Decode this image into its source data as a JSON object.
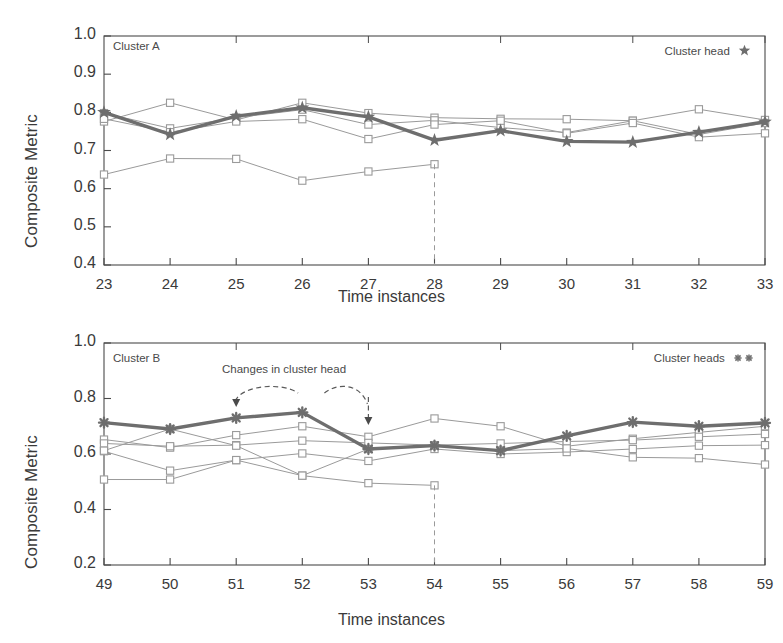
{
  "figure": {
    "background": "#ffffff",
    "ink_color": "#4a4a4a",
    "series_line_color": "#9a9a9a",
    "highlight_color": "#6e6e6e"
  },
  "panels": [
    {
      "id": "cluster-a",
      "tag": "Cluster A",
      "legend_text": "Cluster head",
      "legend_marker": "star",
      "legend_marker_count": 1,
      "xlabel": "Time instances",
      "ylabel": "Composite Metric"
    },
    {
      "id": "cluster-b",
      "tag": "Cluster B",
      "legend_text": "Cluster heads",
      "legend_marker": "asterisk",
      "legend_marker_count": 2,
      "xlabel": "Time instances",
      "ylabel": "Composite Metric",
      "annotation": "Changes in cluster head"
    }
  ],
  "chart_data": [
    {
      "type": "line",
      "id": "cluster-a",
      "title": "Cluster A",
      "xlabel": "Time instances",
      "ylabel": "Composite Metric",
      "x": [
        23,
        24,
        25,
        26,
        27,
        28,
        29,
        30,
        31,
        32,
        33
      ],
      "xticks": [
        "23",
        "24",
        "25",
        "26",
        "27",
        "28",
        "29",
        "30",
        "31",
        "32",
        "33"
      ],
      "yticks": [
        "0.4",
        "0.5",
        "0.6",
        "0.7",
        "0.8",
        "0.9",
        "1.0"
      ],
      "xlim": [
        23,
        33
      ],
      "ylim": [
        0.4,
        1.0
      ],
      "grid": false,
      "legend": "Cluster head",
      "legend_position": "top-right",
      "series": [
        {
          "name": "cluster head",
          "role": "highlight",
          "marker": "star",
          "linewidth": "thick",
          "values": [
            0.8,
            0.742,
            0.79,
            0.812,
            0.788,
            0.727,
            0.752,
            0.724,
            0.722,
            0.748,
            0.775
          ]
        },
        {
          "name": "member 1",
          "role": "member",
          "marker": "square",
          "linewidth": "thin",
          "values": [
            0.776,
            0.825,
            0.78,
            0.825,
            0.798,
            0.786,
            0.783,
            0.782,
            0.778,
            0.808,
            0.78
          ]
        },
        {
          "name": "member 2",
          "role": "member",
          "marker": "square",
          "linewidth": "thin",
          "values": [
            0.798,
            0.758,
            0.786,
            0.807,
            0.768,
            0.779,
            0.76,
            0.747,
            0.778,
            0.742,
            0.772
          ]
        },
        {
          "name": "member 3",
          "role": "member",
          "marker": "square",
          "linewidth": "thin",
          "values": [
            0.783,
            0.748,
            0.776,
            0.782,
            0.73,
            0.768,
            0.778,
            0.745,
            0.772,
            0.735,
            0.745
          ]
        },
        {
          "name": "departing member",
          "role": "member-terminating",
          "marker": "square",
          "linewidth": "thin",
          "ends_at": 28,
          "values": [
            0.637,
            0.679,
            0.678,
            0.621,
            0.645,
            0.664
          ]
        }
      ],
      "annotations": [
        {
          "kind": "dashed-vline",
          "x": 28,
          "from_series": "departing member",
          "to": 0.4
        }
      ]
    },
    {
      "type": "line",
      "id": "cluster-b",
      "title": "Cluster B",
      "xlabel": "Time instances",
      "ylabel": "Composite Metric",
      "x": [
        49,
        50,
        51,
        52,
        53,
        54,
        55,
        56,
        57,
        58,
        59
      ],
      "xticks": [
        "49",
        "50",
        "51",
        "52",
        "53",
        "54",
        "55",
        "56",
        "57",
        "58",
        "59"
      ],
      "yticks": [
        "0.2",
        "0.4",
        "0.6",
        "0.8",
        "1.0"
      ],
      "xlim": [
        49,
        59
      ],
      "ylim": [
        0.2,
        1.0
      ],
      "grid": false,
      "legend": "Cluster heads",
      "legend_position": "top-right",
      "series": [
        {
          "name": "cluster head",
          "role": "highlight",
          "marker": "asterisk",
          "linewidth": "thick",
          "values": [
            0.713,
            0.69,
            0.73,
            0.75,
            0.618,
            0.63,
            0.612,
            0.665,
            0.715,
            0.7,
            0.712
          ]
        },
        {
          "name": "member 1",
          "role": "member",
          "marker": "square",
          "linewidth": "thin",
          "values": [
            0.652,
            0.623,
            0.668,
            0.7,
            0.662,
            0.728,
            0.7,
            0.628,
            0.655,
            0.678,
            0.7
          ]
        },
        {
          "name": "member 2",
          "role": "member",
          "marker": "square",
          "linewidth": "thin",
          "values": [
            0.638,
            0.628,
            0.632,
            0.648,
            0.64,
            0.632,
            0.638,
            0.645,
            0.65,
            0.662,
            0.672
          ]
        },
        {
          "name": "member 3",
          "role": "member",
          "marker": "square",
          "linewidth": "thin",
          "values": [
            0.61,
            0.54,
            0.578,
            0.602,
            0.575,
            0.618,
            0.6,
            0.607,
            0.618,
            0.63,
            0.632
          ]
        },
        {
          "name": "member 4",
          "role": "member",
          "marker": "square",
          "linewidth": "thin",
          "values": [
            0.612,
            0.69,
            0.63,
            0.522,
            0.618,
            0.63,
            0.612,
            0.62,
            0.588,
            0.585,
            0.562
          ]
        },
        {
          "name": "departing member",
          "role": "member-terminating",
          "marker": "square",
          "linewidth": "thin",
          "ends_at": 54,
          "values": [
            0.508,
            0.508,
            0.578,
            0.522,
            0.495,
            0.487
          ]
        }
      ],
      "annotations": [
        {
          "kind": "text",
          "text": "Changes in cluster head"
        },
        {
          "kind": "dashed-arrow",
          "points_to_x": 51
        },
        {
          "kind": "dashed-arrow",
          "points_to_x": 53
        },
        {
          "kind": "dashed-vline",
          "x": 54,
          "from_series": "departing member",
          "to": 0.2
        }
      ]
    }
  ]
}
